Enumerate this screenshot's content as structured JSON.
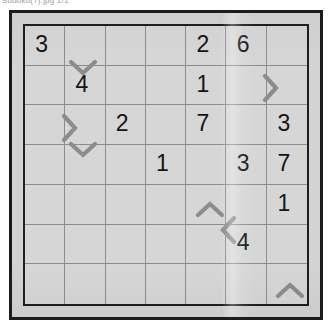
{
  "caption": {
    "text": "Sudoku(7).jpg 1/1"
  },
  "colors": {
    "paper": "#d3d3d3",
    "frame": "#1c1c1c",
    "grid_line": "#8d8d8d",
    "grid_border": "#1f1f1f",
    "digit": "#141414",
    "mark": "#8c8c8c"
  },
  "puzzle": {
    "type": "greater-than-sudoku",
    "rows": 7,
    "cols": 7,
    "cells": [
      [
        {
          "value": "3"
        },
        {
          "value": ""
        },
        {
          "value": ""
        },
        {
          "value": ""
        },
        {
          "value": "2"
        },
        {
          "value": "6"
        },
        {
          "value": ""
        }
      ],
      [
        {
          "value": ""
        },
        {
          "value": "4"
        },
        {
          "value": ""
        },
        {
          "value": ""
        },
        {
          "value": "1"
        },
        {
          "value": ""
        },
        {
          "value": ""
        }
      ],
      [
        {
          "value": ""
        },
        {
          "value": ""
        },
        {
          "value": "2"
        },
        {
          "value": ""
        },
        {
          "value": "7"
        },
        {
          "value": ""
        },
        {
          "value": "3"
        }
      ],
      [
        {
          "value": ""
        },
        {
          "value": ""
        },
        {
          "value": ""
        },
        {
          "value": "1"
        },
        {
          "value": ""
        },
        {
          "value": "3"
        },
        {
          "value": "7"
        }
      ],
      [
        {
          "value": ""
        },
        {
          "value": ""
        },
        {
          "value": ""
        },
        {
          "value": ""
        },
        {
          "value": ""
        },
        {
          "value": ""
        },
        {
          "value": "1"
        }
      ],
      [
        {
          "value": ""
        },
        {
          "value": ""
        },
        {
          "value": ""
        },
        {
          "value": ""
        },
        {
          "value": ""
        },
        {
          "value": "4"
        },
        {
          "value": ""
        }
      ],
      [
        {
          "value": ""
        },
        {
          "value": ""
        },
        {
          "value": ""
        },
        {
          "value": ""
        },
        {
          "value": ""
        },
        {
          "value": ""
        },
        {
          "value": ""
        }
      ]
    ],
    "marks": [
      {
        "name": "inequality-mark-down-r1c2",
        "direction": "down",
        "x": 58,
        "y": 41
      },
      {
        "name": "inequality-mark-right-r2c6",
        "direction": "right",
        "x": 245,
        "y": 62
      },
      {
        "name": "inequality-mark-right-r3c1",
        "direction": "right",
        "x": 44,
        "y": 102
      },
      {
        "name": "inequality-mark-down-r3c2",
        "direction": "down",
        "x": 58,
        "y": 123
      },
      {
        "name": "inequality-mark-up-r5c5",
        "direction": "up",
        "x": 185,
        "y": 184
      },
      {
        "name": "inequality-mark-left-r5c5",
        "direction": "left",
        "x": 204,
        "y": 204
      },
      {
        "name": "inequality-mark-up-r7c7",
        "direction": "up",
        "x": 265,
        "y": 265
      }
    ]
  }
}
